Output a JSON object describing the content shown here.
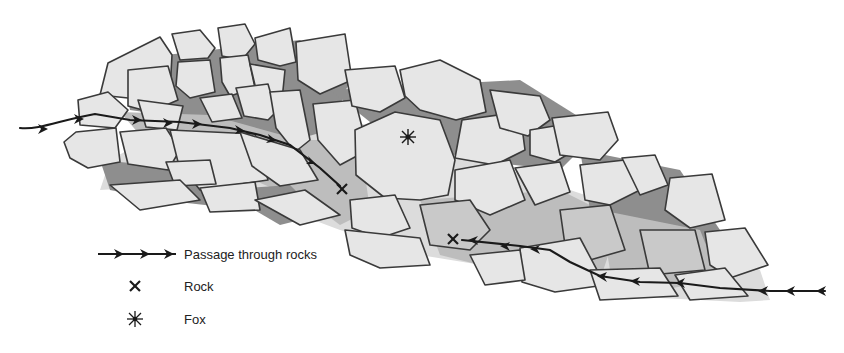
{
  "diagram": {
    "colors": {
      "rock_fill": "#e6e6e6",
      "rock_shaded_fill": "#c9c9c9",
      "gap_dark": "#8e8e8e",
      "gap_mid": "#bdbdbd",
      "outline": "#3a3a3a",
      "path": "#1a1a1a"
    },
    "markers": {
      "rocks": [
        {
          "label": "Rock",
          "x": 342,
          "y": 189
        },
        {
          "label": "Rock",
          "x": 453,
          "y": 239
        }
      ],
      "fox": {
        "label": "Fox",
        "x": 408,
        "y": 137
      }
    }
  },
  "legend": {
    "items": [
      {
        "symbol": "arrow-path",
        "label": "Passage through rocks"
      },
      {
        "symbol": "x-mark",
        "label": "Rock"
      },
      {
        "symbol": "asterisk",
        "label": "Fox"
      }
    ]
  }
}
